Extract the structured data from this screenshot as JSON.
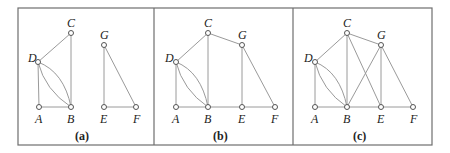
{
  "figure": {
    "panels": [
      {
        "caption": "(a)",
        "nodes": {
          "A": "A",
          "B": "B",
          "C": "C",
          "D": "D",
          "E": "E",
          "F": "F",
          "G": "G"
        },
        "edges": [
          "A-B",
          "A-D",
          "D-B (curve)",
          "D-B (curve)",
          "D-C",
          "C-B",
          "G-E",
          "G-F",
          "E-F"
        ]
      },
      {
        "caption": "(b)",
        "nodes": {
          "A": "A",
          "B": "B",
          "C": "C",
          "D": "D",
          "E": "E",
          "F": "F",
          "G": "G"
        },
        "edges": [
          "A-B",
          "A-D",
          "D-B (curve)",
          "D-B (curve)",
          "D-C",
          "C-B",
          "C-G",
          "G-E",
          "G-F",
          "B-E",
          "E-F"
        ]
      },
      {
        "caption": "(c)",
        "nodes": {
          "A": "A",
          "B": "B",
          "C": "C",
          "D": "D",
          "E": "E",
          "F": "F",
          "G": "G"
        },
        "edges": [
          "A-B",
          "A-D",
          "D-B (curve)",
          "D-B (curve)",
          "D-C",
          "C-B",
          "C-G",
          "C-E",
          "G-B",
          "G-E",
          "G-F",
          "B-E",
          "E-F"
        ]
      }
    ]
  }
}
